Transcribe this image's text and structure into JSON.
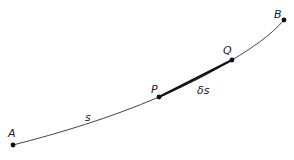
{
  "diagram": {
    "title": "",
    "colors": {
      "curve": "#444444",
      "chord": "#111111",
      "point": "#111111",
      "text": "#222222"
    },
    "points": [
      {
        "id": "A",
        "label": "A",
        "x": 13,
        "y": 145,
        "label_x": 8,
        "label_y": 137
      },
      {
        "id": "P",
        "label": "P",
        "x": 159,
        "y": 97,
        "label_x": 151,
        "label_y": 93
      },
      {
        "id": "Q",
        "label": "Q",
        "x": 232,
        "y": 60,
        "label_x": 223,
        "label_y": 54
      },
      {
        "id": "B",
        "label": "B",
        "x": 284,
        "y": 20,
        "label_x": 274,
        "label_y": 18
      }
    ],
    "arc_label": {
      "text": "s",
      "x": 85,
      "y": 121
    },
    "chord_label": {
      "text": "δs",
      "x": 197,
      "y": 94
    },
    "curve": {
      "from": "A",
      "to": "B",
      "through": [
        "P",
        "Q"
      ]
    },
    "chord": {
      "from": "P",
      "to": "Q"
    }
  }
}
